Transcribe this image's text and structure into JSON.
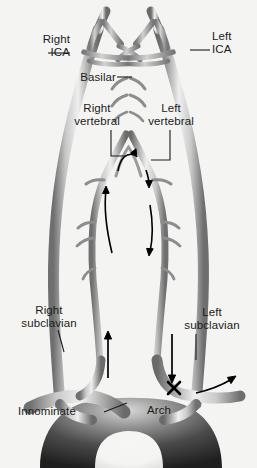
{
  "figure": {
    "background_color": "#f4f4f2",
    "vessel_color_light": "#c9c9c9",
    "vessel_color_dark": "#555555",
    "text_color": "#1b1b1b",
    "marker_color": "#000000"
  },
  "labels": {
    "right_ica": {
      "line1": "Right",
      "line2": "ICA"
    },
    "left_ica": {
      "line1": "Left",
      "line2": "ICA"
    },
    "basilar": {
      "text": "Basilar"
    },
    "right_vertebral": {
      "line1": "Right",
      "line2": "vertebral"
    },
    "left_vertebral": {
      "line1": "Left",
      "line2": "vertebral"
    },
    "right_subclavian": {
      "line1": "Right",
      "line2": "subclavian"
    },
    "left_subclavian": {
      "line1": "Left",
      "line2": "subclavian"
    },
    "innominate": {
      "text": "Innominate"
    },
    "arch": {
      "text": "Arch"
    }
  },
  "markers": {
    "occlusion": {
      "symbol": "X",
      "name": "occlusion-marker"
    }
  },
  "flow_arrows": [
    {
      "name": "right-vertebral-retrograde-curve",
      "direction": "up-right",
      "style": "curved"
    },
    {
      "name": "basilar-crossover-curve",
      "direction": "right",
      "style": "curved"
    },
    {
      "name": "left-vertebral-reversed-flow",
      "direction": "down",
      "style": "straight"
    },
    {
      "name": "right-subclavian-antegrade",
      "direction": "up",
      "style": "straight"
    },
    {
      "name": "left-vertebral-steal-down",
      "direction": "down",
      "style": "straight"
    },
    {
      "name": "left-subclavian-collateral",
      "direction": "right",
      "style": "curved"
    }
  ]
}
